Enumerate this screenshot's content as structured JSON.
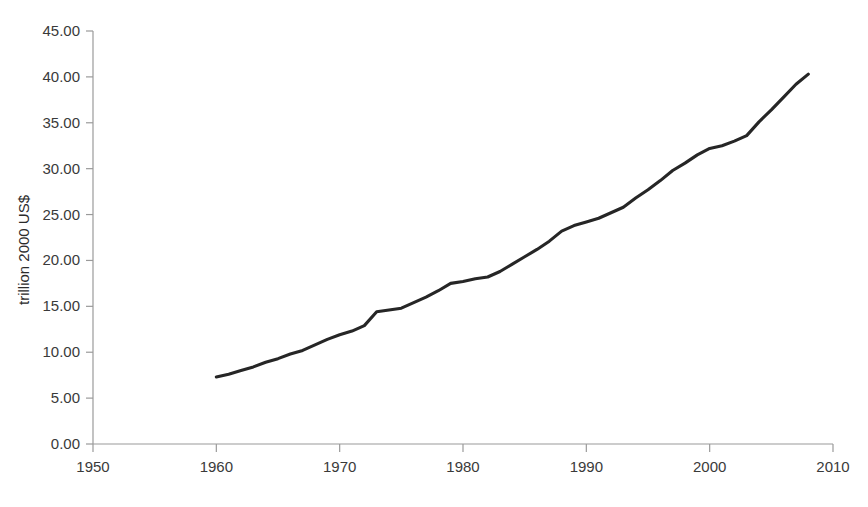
{
  "chart_data": {
    "type": "line",
    "title": "",
    "subtitle": "",
    "xlabel": "",
    "ylabel": "trillion 2000 US$",
    "xlim": [
      1950,
      2010
    ],
    "ylim": [
      0.0,
      45.0
    ],
    "grid": false,
    "legend": null,
    "legend_position": "none",
    "x_tick_labels": [
      "1950",
      "1960",
      "1970",
      "1980",
      "1990",
      "2000",
      "2010"
    ],
    "x_ticks": [
      1950,
      1960,
      1970,
      1980,
      1990,
      2000,
      2010
    ],
    "y_tick_labels": [
      "0.00",
      "5.00",
      "10.00",
      "15.00",
      "20.00",
      "25.00",
      "30.00",
      "35.00",
      "40.00",
      "45.00"
    ],
    "y_ticks": [
      0,
      5,
      10,
      15,
      20,
      25,
      30,
      35,
      40,
      45
    ],
    "series": [
      {
        "name": "Gross world product",
        "color": "#262626",
        "x": [
          1960,
          1961,
          1962,
          1963,
          1964,
          1965,
          1966,
          1967,
          1968,
          1969,
          1970,
          1971,
          1972,
          1973,
          1974,
          1975,
          1976,
          1977,
          1978,
          1979,
          1980,
          1981,
          1982,
          1983,
          1984,
          1985,
          1986,
          1987,
          1988,
          1989,
          1990,
          1991,
          1992,
          1993,
          1994,
          1995,
          1996,
          1997,
          1998,
          1999,
          2000,
          2001,
          2002,
          2003,
          2004,
          2005,
          2006,
          2007,
          2008
        ],
        "values": [
          7.3,
          7.6,
          8.0,
          8.4,
          8.9,
          9.3,
          9.8,
          10.2,
          10.8,
          11.4,
          11.9,
          12.3,
          12.9,
          14.4,
          14.6,
          14.8,
          15.4,
          16.0,
          16.7,
          17.5,
          17.7,
          18.0,
          18.2,
          18.8,
          19.6,
          20.4,
          21.2,
          22.1,
          23.2,
          23.8,
          24.2,
          24.6,
          25.2,
          25.8,
          26.8,
          27.7,
          28.7,
          29.8,
          30.6,
          31.5,
          32.2,
          32.5,
          33.0,
          33.6,
          35.1,
          36.4,
          37.8,
          39.2,
          40.3
        ]
      }
    ]
  },
  "axes": {
    "y_axis_title": "trillion 2000 US$"
  }
}
